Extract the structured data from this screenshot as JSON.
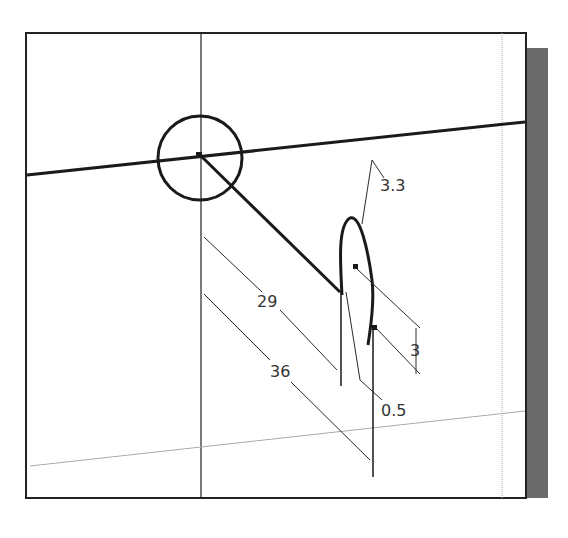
{
  "diagram": {
    "type": "cad-sketch-viewport",
    "colors": {
      "background": "#ffffff",
      "frame": "#222222",
      "shadow": "#6a6a6a",
      "geometry": "#1a1a1a",
      "dimension": "#2a2a2a",
      "construction": "#aaaaaa",
      "text": "#333333"
    },
    "dimensions": [
      {
        "id": "dim-29",
        "label": "29"
      },
      {
        "id": "dim-36",
        "label": "36"
      },
      {
        "id": "dim-3.3",
        "label": "3.3"
      },
      {
        "id": "dim-3",
        "label": "3"
      },
      {
        "id": "dim-0.5",
        "label": "0.5"
      }
    ]
  }
}
